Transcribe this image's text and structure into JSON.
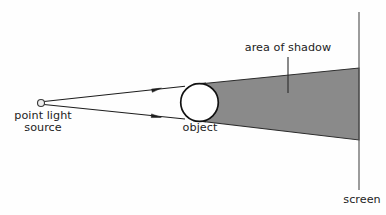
{
  "diagram": {
    "background_color": "#fefefe",
    "stroke_color": "#1c1c1c",
    "shadow_color": "#8a8a8a",
    "labels": {
      "point_light_source": "point light\nsource",
      "point_light_source_line1": "point light",
      "point_light_source_line2": "source",
      "object": "object",
      "area_of_shadow": "area of shadow",
      "screen": "screen"
    },
    "elements": {
      "light_source": {
        "name": "point-light-source-dot",
        "shape": "circle",
        "cx": 41,
        "cy": 103,
        "r": 3.6,
        "fill": "#e8e8e8",
        "stroke": "#3a3a3a"
      },
      "object": {
        "name": "object-circle",
        "shape": "circle",
        "cx": 199.5,
        "cy": 102.5,
        "r": 18.8,
        "fill": "#ffffff",
        "stroke": "#111111",
        "stroke_width": 1.7
      },
      "screen": {
        "name": "screen-line",
        "shape": "line",
        "x": 359,
        "y1": 12,
        "y2": 190,
        "stroke": "#5a5a5a",
        "stroke_width": 1.2
      },
      "ray_upper": {
        "name": "light-ray-upper",
        "x1": 43,
        "y1": 101,
        "x2": 184,
        "y2": 86,
        "arrow_at_x": 158,
        "arrow_at_y": 88.8
      },
      "ray_lower": {
        "name": "light-ray-lower",
        "x1": 43,
        "y1": 105,
        "x2": 184,
        "y2": 119,
        "arrow_at_x": 158,
        "arrow_at_y": 116.5
      },
      "shadow_region": {
        "name": "shadow-cone",
        "points": "199,84 359,68 359,140 199,121",
        "fill": "#8a8a8a",
        "stroke": "#2a2a2a",
        "stroke_width": 1.1
      },
      "leader_line_shadow": {
        "name": "area-of-shadow-leader-line",
        "x": 288,
        "y1": 57,
        "y2": 93,
        "stroke": "#2a2a2a",
        "stroke_width": 1.1
      }
    }
  }
}
